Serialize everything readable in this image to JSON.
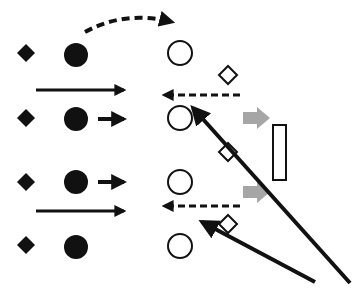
{
  "diagram": {
    "colors": {
      "ink": "#111111",
      "gray_arrow": "#a6a6a6",
      "background": "#ffffff"
    },
    "filled_diamonds": [
      {
        "cx": 26,
        "cy": 53
      },
      {
        "cx": 26,
        "cy": 118
      },
      {
        "cx": 26,
        "cy": 182
      },
      {
        "cx": 26,
        "cy": 245
      }
    ],
    "filled_circles": [
      {
        "cx": 76,
        "cy": 55
      },
      {
        "cx": 76,
        "cy": 119
      },
      {
        "cx": 76,
        "cy": 182
      },
      {
        "cx": 76,
        "cy": 247
      }
    ],
    "open_circles": [
      {
        "cx": 180,
        "cy": 53
      },
      {
        "cx": 180,
        "cy": 118
      },
      {
        "cx": 180,
        "cy": 182
      },
      {
        "cx": 180,
        "cy": 246
      }
    ],
    "open_diamonds": [
      {
        "cx": 228,
        "cy": 75
      },
      {
        "cx": 228,
        "cy": 152
      },
      {
        "cx": 228,
        "cy": 224
      }
    ],
    "rectangle": {
      "x": 273,
      "y": 125,
      "w": 13,
      "h": 55
    },
    "long_arrows_right": [
      {
        "x1": 36,
        "y1": 90,
        "x2": 124
      },
      {
        "x1": 36,
        "y1": 211,
        "x2": 124
      }
    ],
    "short_arrows_right": [
      {
        "x1": 98,
        "y1": 119,
        "x2": 124
      },
      {
        "x1": 98,
        "y1": 182,
        "x2": 124
      }
    ],
    "dashed_arrows_left": [
      {
        "x1": 240,
        "y1": 95,
        "x2": 164
      },
      {
        "x1": 240,
        "y1": 206,
        "x2": 164
      }
    ],
    "dashed_curve": {
      "d": "M85 32 Q125 10 172 22"
    },
    "gray_arrows": [
      {
        "x": 243,
        "y": 118
      },
      {
        "x": 243,
        "y": 192
      }
    ],
    "diagonal_arrows": [
      {
        "x1": 350,
        "y1": 283,
        "x2": 193,
        "y2": 108
      },
      {
        "x1": 315,
        "y1": 282,
        "x2": 202,
        "y2": 222
      }
    ]
  }
}
